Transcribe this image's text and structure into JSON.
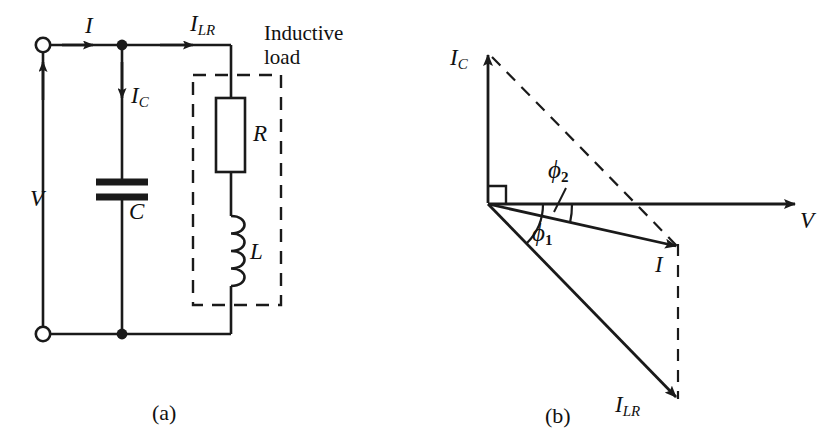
{
  "figure": {
    "width": 826,
    "height": 437,
    "background": "#ffffff",
    "stroke_color": "#1a1a1a",
    "text_color": "#111111"
  },
  "panel_a": {
    "caption": "(a)",
    "title_note": "Inductive\nload",
    "labels": {
      "source_voltage": "V",
      "total_current": "I",
      "capacitor_current_main": "I",
      "capacitor_current_sub": "C",
      "load_current_main": "I",
      "load_current_sub": "LR",
      "resistor": "R",
      "inductor": "L",
      "capacitor": "C"
    },
    "components": [
      {
        "name": "resistor",
        "label": "R"
      },
      {
        "name": "inductor",
        "label": "L"
      },
      {
        "name": "capacitor",
        "label": "C"
      }
    ],
    "dashed_box_label": "Inductive load"
  },
  "panel_b": {
    "caption": "(b)",
    "labels": {
      "capacitive_current_main": "I",
      "capacitive_current_sub": "C",
      "voltage": "V",
      "total_current": "I",
      "load_current_main": "I",
      "load_current_sub": "LR",
      "angle_1_main": "ϕ",
      "angle_1_sub": "1",
      "angle_2_main": "ϕ",
      "angle_2_sub": "2"
    },
    "phasors": [
      {
        "name": "I_C",
        "label": "I_C",
        "direction": "up",
        "style": "solid"
      },
      {
        "name": "V",
        "label": "V",
        "direction": "right",
        "style": "solid"
      },
      {
        "name": "I",
        "label": "I",
        "direction": "down-right",
        "style": "solid"
      },
      {
        "name": "I_LR",
        "label": "I_LR",
        "direction": "down-right-steep",
        "style": "solid"
      }
    ],
    "construction_lines": [
      {
        "name": "ic-to-ilr-tip",
        "style": "dashed"
      },
      {
        "name": "vertical-projection",
        "style": "dashed"
      }
    ],
    "right_angle_marker": true
  }
}
